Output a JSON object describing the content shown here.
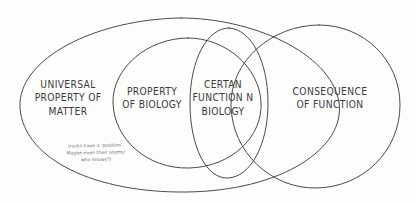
{
  "diagram": {
    "type": "venn",
    "title": "",
    "style": "hand-drawn pencil sketch on white paper",
    "stroke_color": "#4a4a4a",
    "text_color": "#3c3c3c",
    "note_color": "#6b6b6b",
    "background_color": "#fdfdfc",
    "sets": [
      {
        "id": "universal-property-of-matter",
        "label": "UNIVERSAL\nPROPERTY OF\nMATTER",
        "position": "outer-left"
      },
      {
        "id": "property-of-biology",
        "label": "PROPERTY\nOF BIOLOGY",
        "position": "inner-left"
      },
      {
        "id": "certain-function-in-biology",
        "label": "CERTAN\nFUNCTION N\nBIOLOGY",
        "position": "center"
      },
      {
        "id": "consequence-of-function",
        "label": "CONSEQUENCE\nOF FUNCTION",
        "position": "outer-right"
      }
    ],
    "annotation": {
      "id": "rocks-aside",
      "text": "(rocks have a 'position'.\nMaybe even their atoms!\nwho knows?)"
    }
  }
}
